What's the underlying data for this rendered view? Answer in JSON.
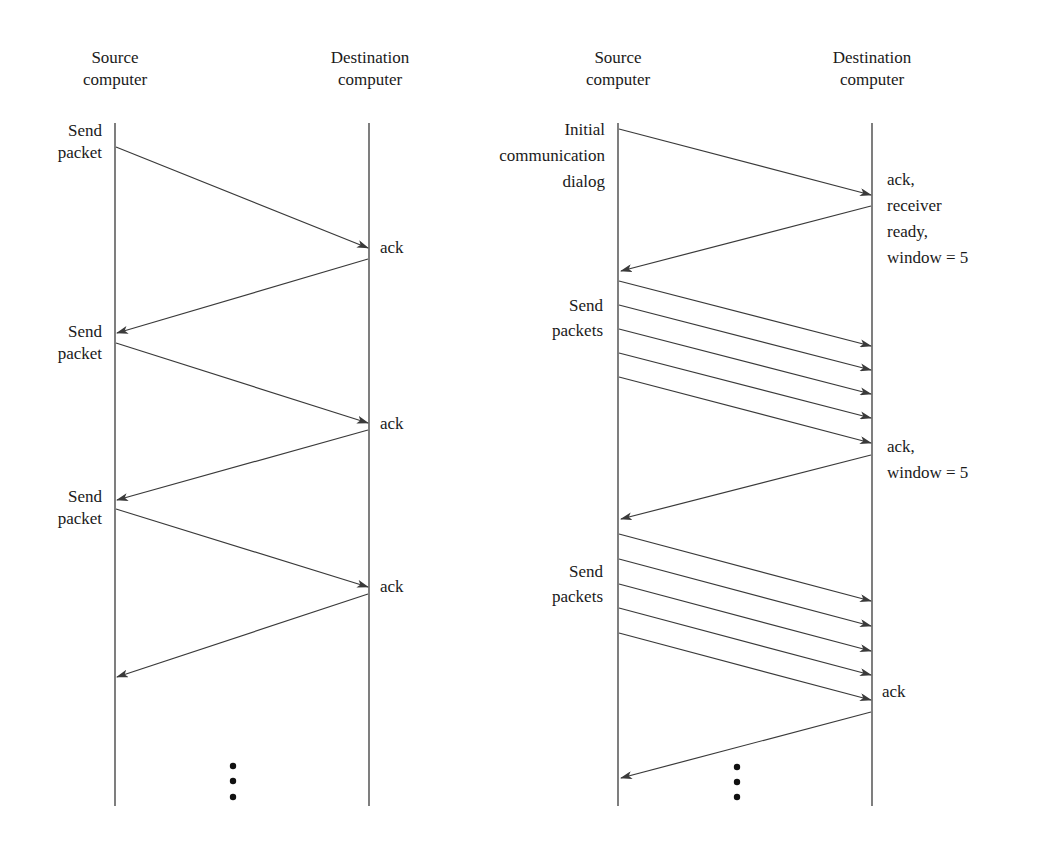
{
  "left_diagram": {
    "title": "Stop-and-wait flow control",
    "source_header": [
      "Source",
      "computer"
    ],
    "destination_header": [
      "Destination",
      "computer"
    ],
    "source_labels": [
      [
        "Send",
        "packet"
      ],
      [
        "Send",
        "packet"
      ],
      [
        "Send",
        "packet"
      ]
    ],
    "destination_labels": [
      "ack",
      "ack",
      "ack"
    ],
    "continuation": "..."
  },
  "right_diagram": {
    "title": "Sliding window flow control",
    "source_header": [
      "Source",
      "computer"
    ],
    "destination_header": [
      "Destination",
      "computer"
    ],
    "source_labels": [
      [
        "Initial",
        "communication",
        "dialog"
      ],
      [
        "Send",
        "packets"
      ],
      [
        "Send",
        "packets"
      ]
    ],
    "destination_labels": [
      [
        "ack,",
        "receiver",
        "ready,",
        "window = 5"
      ],
      [
        "ack,",
        "window = 5"
      ],
      [
        "ack"
      ]
    ],
    "window_size": 5,
    "packets_per_burst": 5,
    "continuation": "..."
  },
  "colors": {
    "line": "#3a3a3a",
    "text": "#1a1a1a",
    "background": "#ffffff"
  }
}
